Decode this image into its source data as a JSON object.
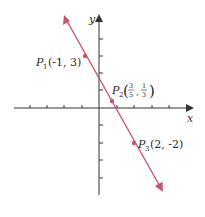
{
  "figure": {
    "type": "coordinate-plane",
    "axes": {
      "x_label": "x",
      "y_label": "y",
      "x_ticks": [
        -5,
        -4,
        -3,
        -2,
        -1,
        1,
        2,
        3,
        4
      ],
      "y_ticks": [
        -4,
        -3,
        -2,
        -1,
        1,
        2,
        3,
        4
      ]
    },
    "line": {
      "color": "#c4566e",
      "description": "line through P1, P2, P3 with arrows at both ends"
    },
    "points": [
      {
        "name": "P",
        "sub": "1",
        "coords": "(-1, 3)",
        "x": -1,
        "y": 3
      },
      {
        "name": "P",
        "sub": "2",
        "coords_num_x": "3",
        "coords_den_x": "5",
        "coords_num_y": "1",
        "coords_den_y": "3",
        "x": 0.6,
        "y": 0.333
      },
      {
        "name": "P",
        "sub": "3",
        "coords": "(2, -2)",
        "x": 2,
        "y": -2
      }
    ]
  }
}
